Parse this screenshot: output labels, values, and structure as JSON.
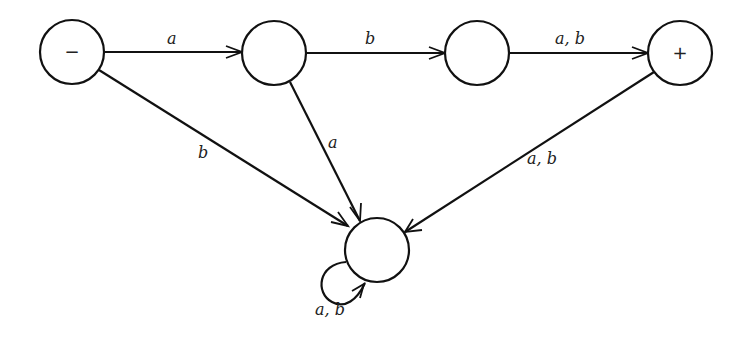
{
  "diagram": {
    "type": "finite-automaton",
    "states": [
      {
        "id": "s1",
        "label": "−",
        "role": "start",
        "cx": 72,
        "cy": 52
      },
      {
        "id": "s2",
        "label": "",
        "role": "intermediate",
        "cx": 274,
        "cy": 53
      },
      {
        "id": "s3",
        "label": "",
        "role": "intermediate",
        "cx": 477,
        "cy": 53
      },
      {
        "id": "s4",
        "label": "+",
        "role": "final",
        "cx": 680,
        "cy": 53
      },
      {
        "id": "s5",
        "label": "",
        "role": "trap",
        "cx": 377,
        "cy": 250
      }
    ],
    "edges": [
      {
        "from": "s1",
        "to": "s2",
        "label": "a"
      },
      {
        "from": "s2",
        "to": "s3",
        "label": "b"
      },
      {
        "from": "s3",
        "to": "s4",
        "label": "a, b"
      },
      {
        "from": "s1",
        "to": "s5",
        "label": "b"
      },
      {
        "from": "s2",
        "to": "s5",
        "label": "a"
      },
      {
        "from": "s4",
        "to": "s5",
        "label": "a, b"
      },
      {
        "from": "s5",
        "to": "s5",
        "label": "a, b"
      }
    ]
  }
}
